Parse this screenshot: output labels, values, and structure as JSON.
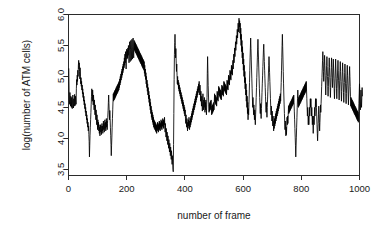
{
  "chart_data": {
    "type": "line",
    "title": "",
    "subtitle": "",
    "xlabel": "number of frame",
    "ylabel": "log(number of ATM cells)",
    "xlim": [
      0,
      1000
    ],
    "ylim": [
      3.4,
      6.0
    ],
    "xticks": [
      0,
      200,
      400,
      600,
      800,
      1000
    ],
    "xticklabels": [
      "0",
      "200",
      "400",
      "600",
      "800",
      "1000"
    ],
    "yticks": [
      3.5,
      4.0,
      4.5,
      5.0,
      5.5,
      6.0
    ],
    "yticklabels": [
      "3.5",
      "4.0",
      "4.5",
      "5.0",
      "5.5",
      "6.0"
    ],
    "grid": false,
    "legend": null,
    "legend_position": "none",
    "line_color": "#000000",
    "background_color": "#ffffff",
    "box": true,
    "annotations": [],
    "series": [
      {
        "name": "log(number of ATM cells)",
        "x_start": 1,
        "x_step": 1,
        "values": [
          5.13,
          4.78,
          4.62,
          4.55,
          4.74,
          4.6,
          4.52,
          4.68,
          4.58,
          4.5,
          4.66,
          4.55,
          4.48,
          4.62,
          4.7,
          4.56,
          4.49,
          4.64,
          4.58,
          4.52,
          4.71,
          4.6,
          4.53,
          4.68,
          4.62,
          4.55,
          4.8,
          4.95,
          4.86,
          5.02,
          4.92,
          5.1,
          5.0,
          5.18,
          5.26,
          5.12,
          5.22,
          5.08,
          4.96,
          5.14,
          5.0,
          4.88,
          4.98,
          4.84,
          4.92,
          4.78,
          4.86,
          4.72,
          4.8,
          4.66,
          4.74,
          4.6,
          4.68,
          4.54,
          4.62,
          4.48,
          4.56,
          4.42,
          4.5,
          4.36,
          4.44,
          4.3,
          4.38,
          4.24,
          4.32,
          4.18,
          4.26,
          4.12,
          4.2,
          4.06,
          3.95,
          3.7,
          3.88,
          4.05,
          4.18,
          4.3,
          4.42,
          4.55,
          4.68,
          4.8,
          4.72,
          4.6,
          4.78,
          4.66,
          4.54,
          4.7,
          4.58,
          4.46,
          4.62,
          4.5,
          4.38,
          4.54,
          4.42,
          4.3,
          4.46,
          4.34,
          4.22,
          4.38,
          4.26,
          4.14,
          4.3,
          4.18,
          4.26,
          4.12,
          4.22,
          4.08,
          4.18,
          4.04,
          4.14,
          4.22,
          4.1,
          4.2,
          4.06,
          4.16,
          4.24,
          4.12,
          4.2,
          4.08,
          4.18,
          4.28,
          4.14,
          4.24,
          4.1,
          4.2,
          4.3,
          4.16,
          4.26,
          4.12,
          4.22,
          4.32,
          4.18,
          4.28,
          4.14,
          4.24,
          4.34,
          4.45,
          4.58,
          4.7,
          4.56,
          4.42,
          4.3,
          4.45,
          4.32,
          4.18,
          4.05,
          3.9,
          3.72,
          3.88,
          4.02,
          4.18,
          4.32,
          4.46,
          4.6,
          4.72,
          4.6,
          4.74,
          4.62,
          4.76,
          4.64,
          4.78,
          4.66,
          4.8,
          4.68,
          4.82,
          4.7,
          4.84,
          4.72,
          4.86,
          4.74,
          4.88,
          4.76,
          4.9,
          4.78,
          4.92,
          4.82,
          4.96,
          4.86,
          5.0,
          4.9,
          5.04,
          4.94,
          5.08,
          4.98,
          5.12,
          5.02,
          5.16,
          5.06,
          5.2,
          5.1,
          5.24,
          5.14,
          5.3,
          5.18,
          5.36,
          5.22,
          5.4,
          5.26,
          5.12,
          5.3,
          5.44,
          5.28,
          5.42,
          5.3,
          5.46,
          5.34,
          5.5,
          5.38,
          5.22,
          5.42,
          5.56,
          5.4,
          5.24,
          5.44,
          5.58,
          5.42,
          5.26,
          5.46,
          5.6,
          5.44,
          5.28,
          5.48,
          5.62,
          5.46,
          5.3,
          5.5,
          5.58,
          5.42,
          5.56,
          5.4,
          5.54,
          5.38,
          5.52,
          5.36,
          5.5,
          5.34,
          5.48,
          5.32,
          5.46,
          5.3,
          5.44,
          5.28,
          5.42,
          5.26,
          5.4,
          5.24,
          5.38,
          5.22,
          5.36,
          5.2,
          5.34,
          5.18,
          5.32,
          5.16,
          5.3,
          5.14,
          5.28,
          5.12,
          5.26,
          5.1,
          5.24,
          5.05,
          5.18,
          5.0,
          5.12,
          4.95,
          5.06,
          4.88,
          5.0,
          4.82,
          4.94,
          4.76,
          4.88,
          4.7,
          4.82,
          4.64,
          4.76,
          4.58,
          4.7,
          4.52,
          4.64,
          4.46,
          4.58,
          4.4,
          4.52,
          4.34,
          4.46,
          4.3,
          4.42,
          4.26,
          4.38,
          4.22,
          4.34,
          4.18,
          4.3,
          4.16,
          4.28,
          4.14,
          4.26,
          4.12,
          4.24,
          4.1,
          4.22,
          4.08,
          4.2,
          4.14,
          4.26,
          4.12,
          4.24,
          4.1,
          4.22,
          4.16,
          4.28,
          4.14,
          4.26,
          4.12,
          4.24,
          4.18,
          4.3,
          4.16,
          4.28,
          4.14,
          4.26,
          4.2,
          4.32,
          4.18,
          4.3,
          4.16,
          4.28,
          4.22,
          4.34,
          4.2,
          4.1,
          4.24,
          4.12,
          4.02,
          4.16,
          4.06,
          3.96,
          4.1,
          4.0,
          3.9,
          4.04,
          3.94,
          3.84,
          3.98,
          3.88,
          3.78,
          3.92,
          3.82,
          3.72,
          3.86,
          3.76,
          3.66,
          3.8,
          3.7,
          3.58,
          3.72,
          3.62,
          3.5,
          3.46,
          3.9,
          4.4,
          4.95,
          5.35,
          5.55,
          5.68,
          5.5,
          5.3,
          5.45,
          5.25,
          5.08,
          5.2,
          5.02,
          4.88,
          5.0,
          4.86,
          4.94,
          4.8,
          4.9,
          4.76,
          4.86,
          4.72,
          4.82,
          4.68,
          4.78,
          4.64,
          4.74,
          4.6,
          4.7,
          4.56,
          4.66,
          4.52,
          4.62,
          4.48,
          4.58,
          4.44,
          4.54,
          4.4,
          4.5,
          4.36,
          4.46,
          4.32,
          4.24,
          4.38,
          4.28,
          4.18,
          4.32,
          4.22,
          4.12,
          4.26,
          4.16,
          4.3,
          4.2,
          4.34,
          4.24,
          4.14,
          4.28,
          4.18,
          4.32,
          4.22,
          4.36,
          4.26,
          4.4,
          4.3,
          4.44,
          4.34,
          4.48,
          4.38,
          4.52,
          4.42,
          4.56,
          4.46,
          4.6,
          4.5,
          4.64,
          4.54,
          4.68,
          4.58,
          4.72,
          4.62,
          4.76,
          4.66,
          4.8,
          4.7,
          4.84,
          4.74,
          4.88,
          4.78,
          4.92,
          4.82,
          4.7,
          4.86,
          4.74,
          4.6,
          4.76,
          4.64,
          4.52,
          4.68,
          4.56,
          4.44,
          4.6,
          4.72,
          4.58,
          4.46,
          4.62,
          4.5,
          4.66,
          4.54,
          4.42,
          4.58,
          4.46,
          4.62,
          4.5,
          4.38,
          4.54,
          4.66,
          5.05,
          5.32,
          5.1,
          4.85,
          4.7,
          4.55,
          4.42,
          4.56,
          4.44,
          4.58,
          4.46,
          4.6,
          4.48,
          4.62,
          4.5,
          4.38,
          4.52,
          4.4,
          4.54,
          4.42,
          4.56,
          4.44,
          4.58,
          4.46,
          4.6,
          4.72,
          4.58,
          4.7,
          4.56,
          4.68,
          4.54,
          4.66,
          4.52,
          4.64,
          4.76,
          4.62,
          4.74,
          4.6,
          4.72,
          4.84,
          4.7,
          4.82,
          4.68,
          4.8,
          4.66,
          4.78,
          4.64,
          4.76,
          4.62,
          4.74,
          4.86,
          4.72,
          4.84,
          4.7,
          4.82,
          4.68,
          4.8,
          4.92,
          4.78,
          4.9,
          4.76,
          4.88,
          4.74,
          4.86,
          4.72,
          4.84,
          4.7,
          4.82,
          4.94,
          4.8,
          4.92,
          4.78,
          4.9,
          5.02,
          4.88,
          5.0,
          4.86,
          4.98,
          5.1,
          4.96,
          5.08,
          4.94,
          5.06,
          5.18,
          5.04,
          5.16,
          5.02,
          5.14,
          5.26,
          5.12,
          5.24,
          5.36,
          5.22,
          5.34,
          5.46,
          5.32,
          5.44,
          5.56,
          5.42,
          5.54,
          5.66,
          5.52,
          5.64,
          5.76,
          5.62,
          5.74,
          5.86,
          5.72,
          5.84,
          5.94,
          5.8,
          5.9,
          5.7,
          5.86,
          5.6,
          5.78,
          5.5,
          5.68,
          5.4,
          5.58,
          5.3,
          5.48,
          5.2,
          5.38,
          5.1,
          5.28,
          5.0,
          5.18,
          4.9,
          5.08,
          4.8,
          4.98,
          4.7,
          4.88,
          4.6,
          4.78,
          4.5,
          4.68,
          4.4,
          4.58,
          4.3,
          4.48,
          4.38,
          4.55,
          4.7,
          4.9,
          5.1,
          5.3,
          5.46,
          5.62,
          5.45,
          5.28,
          5.12,
          4.96,
          4.8,
          4.64,
          4.5,
          4.66,
          4.52,
          4.38,
          4.54,
          4.42,
          4.3,
          4.46,
          4.34,
          4.22,
          4.38,
          4.5,
          4.66,
          4.82,
          4.98,
          5.14,
          5.3,
          5.46,
          5.6,
          5.44,
          5.28,
          5.12,
          4.96,
          4.8,
          4.66,
          4.52,
          4.4,
          4.56,
          4.44,
          4.32,
          4.48,
          4.6,
          4.74,
          4.88,
          5.02,
          5.16,
          5.3,
          5.44,
          5.52,
          5.38,
          5.24,
          5.1,
          4.96,
          4.82,
          4.68,
          4.54,
          4.42,
          4.58,
          4.46,
          4.34,
          4.5,
          4.62,
          4.76,
          4.9,
          5.04,
          5.18,
          5.32,
          5.2,
          5.06,
          4.92,
          4.78,
          4.64,
          4.5,
          4.38,
          4.52,
          4.4,
          4.28,
          4.44,
          4.32,
          4.2,
          4.36,
          4.24,
          4.12,
          4.28,
          4.16,
          4.32,
          4.2,
          4.36,
          4.24,
          4.4,
          4.28,
          4.44,
          4.32,
          4.48,
          4.36,
          4.52,
          4.4,
          4.56,
          4.44,
          4.6,
          4.48,
          4.64,
          4.52,
          4.68,
          4.56,
          4.72,
          4.6,
          4.76,
          4.9,
          5.1,
          5.3,
          5.5,
          5.68,
          5.48,
          5.28,
          5.08,
          4.88,
          4.7,
          4.54,
          4.4,
          4.26,
          4.14,
          4.28,
          4.16,
          4.04,
          4.18,
          4.06,
          4.2,
          4.34,
          4.22,
          4.36,
          4.24,
          4.38,
          4.52,
          4.4,
          4.54,
          4.42,
          4.56,
          4.44,
          4.58,
          4.46,
          4.6,
          4.48,
          4.62,
          4.5,
          4.64,
          4.52,
          4.66,
          4.54,
          4.68,
          4.56,
          4.7,
          4.58,
          4.44,
          4.3,
          4.16,
          4.02,
          3.88,
          3.7,
          3.86,
          4.02,
          4.18,
          4.34,
          4.5,
          4.64,
          4.78,
          4.64,
          4.5,
          4.66,
          4.52,
          4.68,
          4.54,
          4.7,
          4.56,
          4.72,
          4.58,
          4.74,
          4.6,
          4.76,
          4.62,
          4.78,
          4.64,
          4.8,
          4.66,
          4.82,
          4.68,
          4.84,
          4.7,
          4.86,
          4.72,
          4.88,
          4.74,
          4.9,
          4.76,
          4.92,
          4.78,
          4.64,
          4.5,
          4.36,
          4.5,
          4.36,
          4.22,
          4.36,
          4.22,
          4.36,
          4.5,
          4.36,
          4.5,
          4.64,
          4.5,
          4.64,
          4.5,
          4.36,
          4.5,
          4.36,
          4.22,
          4.36,
          4.22,
          4.08,
          4.22,
          4.36,
          4.22,
          4.36,
          4.5,
          4.36,
          4.5,
          4.64,
          4.5,
          4.64,
          4.5,
          4.36,
          4.22,
          4.08,
          3.96,
          4.1,
          4.24,
          4.38,
          4.52,
          4.4,
          4.26,
          4.12,
          4.26,
          4.4,
          4.54,
          4.42,
          4.56,
          4.7,
          4.84,
          4.98,
          5.12,
          5.26,
          5.4,
          5.24,
          5.08,
          4.92,
          5.06,
          5.2,
          5.34,
          5.18,
          5.02,
          4.86,
          4.7,
          4.86,
          5.02,
          5.18,
          5.32,
          5.16,
          5.0,
          4.84,
          4.68,
          4.84,
          5.0,
          5.16,
          5.3,
          5.14,
          4.98,
          4.82,
          4.66,
          4.82,
          4.98,
          5.14,
          5.3,
          5.14,
          4.98,
          4.82,
          4.96,
          5.12,
          5.28,
          5.12,
          4.96,
          4.8,
          4.64,
          4.8,
          4.96,
          5.12,
          5.28,
          5.12,
          4.96,
          4.8,
          4.64,
          4.8,
          4.96,
          5.12,
          5.26,
          5.1,
          4.94,
          4.78,
          4.62,
          4.78,
          4.94,
          5.1,
          5.24,
          5.08,
          4.92,
          4.76,
          4.6,
          4.76,
          4.92,
          5.08,
          5.22,
          5.06,
          4.9,
          4.74,
          4.58,
          4.74,
          4.9,
          5.06,
          5.2,
          5.04,
          4.88,
          4.72,
          4.56,
          4.72,
          4.88,
          5.04,
          5.18,
          5.02,
          4.86,
          4.7,
          4.54,
          4.7,
          4.86,
          5.02,
          5.16,
          5.0,
          4.84,
          4.68,
          4.52,
          4.66,
          4.5,
          4.64,
          4.48,
          4.62,
          4.46,
          4.6,
          4.44,
          4.58,
          4.42,
          4.56,
          4.4,
          4.54,
          4.38,
          4.52,
          4.36,
          4.5,
          4.34,
          4.48,
          4.32,
          4.46,
          4.3,
          4.44,
          4.28,
          4.42,
          4.26,
          4.4,
          4.56,
          4.72,
          4.88,
          4.74,
          4.6,
          4.46,
          4.62,
          4.78,
          4.64,
          4.5,
          4.66,
          4.82,
          4.68
        ]
      }
    ]
  }
}
